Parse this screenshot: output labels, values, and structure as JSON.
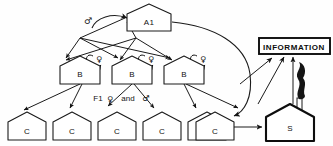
{
  "diagram": {
    "nodes": {
      "top": {
        "id": "a1",
        "label": "A1",
        "shape": "house"
      },
      "middle": [
        {
          "id": "b1",
          "label": "B",
          "shape": "house"
        },
        {
          "id": "b2",
          "label": "B",
          "shape": "house"
        },
        {
          "id": "b3",
          "label": "B",
          "shape": "house"
        }
      ],
      "bottom": [
        {
          "id": "c1",
          "label": "C",
          "shape": "house"
        },
        {
          "id": "c2",
          "label": "C",
          "shape": "house"
        },
        {
          "id": "c3",
          "label": "C",
          "shape": "house"
        },
        {
          "id": "c4",
          "label": "C",
          "shape": "house"
        },
        {
          "id": "c5",
          "label": "C",
          "shape": "house"
        },
        {
          "id": "c6",
          "label": "C",
          "shape": "house"
        }
      ],
      "station": {
        "id": "s",
        "label": "S",
        "shape": "house-thick-chimney"
      },
      "information": {
        "id": "information",
        "label": "INFORMATION",
        "shape": "rectangle"
      }
    },
    "symbols": {
      "male": "♂",
      "female": "♀",
      "male_top_label": "♂",
      "female_b1": "♀",
      "female_b2": "♀",
      "female_b3": "♀"
    },
    "annotations": {
      "generation": "F1",
      "generation_female": "♀",
      "generation_conjunction": "and",
      "generation_male": "♂"
    },
    "colors": {
      "stroke": "#1a1a1a",
      "background": "#ffffff",
      "smoke": "#141414",
      "text": "#111111"
    }
  }
}
